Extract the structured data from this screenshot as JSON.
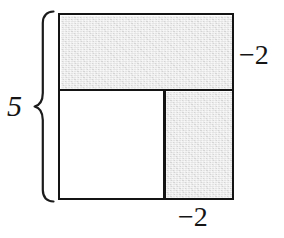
{
  "figure": {
    "shape": "square",
    "outer_side_label": "5",
    "labels": {
      "left_dimension": "5",
      "right_dimension": "−2",
      "bottom_dimension": "−2"
    },
    "brace": {
      "name": "left-brace",
      "orientation": "vertical",
      "label": "5"
    },
    "regions": [
      {
        "name": "top-strip",
        "shaded": true,
        "position": "top",
        "width_fraction": "5",
        "height_fraction": "2"
      },
      {
        "name": "right-column",
        "shaded": true,
        "position": "bottom-right",
        "width_fraction": "2",
        "height_fraction": "3"
      },
      {
        "name": "inner-square",
        "shaded": false,
        "position": "bottom-left",
        "width_fraction": "3",
        "height_fraction": "3"
      }
    ],
    "colors": {
      "outline": "#141414",
      "shaded_fill": "#e3e3e3",
      "plain_fill": "#ffffff",
      "background": "#ffffff",
      "label_text": "#151515"
    }
  }
}
